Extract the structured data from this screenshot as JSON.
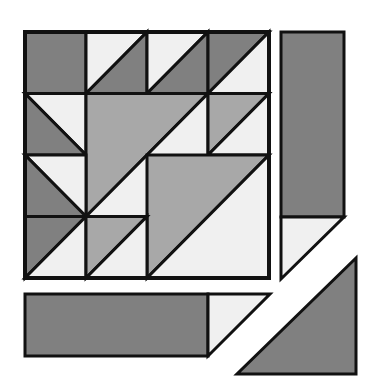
{
  "diagram": {
    "kind": "quilt-block-cutting-layout",
    "canvas": {
      "width": 368,
      "height": 383,
      "background": "#ffffff"
    },
    "palette": {
      "dark": "#808080",
      "medium": "#a8a8a8",
      "light": "#f0f0f0",
      "outline": "#111111",
      "background": "#ffffff"
    },
    "stroke_width": 3,
    "main_block": {
      "label": "Main pieced block",
      "x": 25,
      "y": 32,
      "width": 244,
      "height": 246,
      "grid_rows": 4,
      "grid_cols": 4,
      "cell_width": 61,
      "cell_height": 61.5,
      "units": [
        {
          "name": "r1c1-solid-dark",
          "row": 1,
          "col": 1,
          "type": "solid",
          "fill": "dark"
        },
        {
          "name": "r1c2-hst-light-dark",
          "row": 1,
          "col": 2,
          "type": "hst",
          "orientation": "tl-br",
          "fill_upper": "light",
          "fill_lower": "dark"
        },
        {
          "name": "r1c3-hst-light-dark",
          "row": 1,
          "col": 3,
          "type": "hst",
          "orientation": "tl-br",
          "fill_upper": "light",
          "fill_lower": "dark"
        },
        {
          "name": "r1c4-hst-dark-light",
          "row": 1,
          "col": 4,
          "type": "hst",
          "orientation": "tl-br",
          "fill_upper": "dark",
          "fill_lower": "light"
        },
        {
          "name": "r2c1-hst-dark-light",
          "row": 2,
          "col": 1,
          "type": "hst",
          "orientation": "tl-br",
          "fill_upper": "light",
          "fill_lower": "dark"
        },
        {
          "name": "r2c4-hst-medium-light",
          "row": 2,
          "col": 4,
          "type": "hst",
          "orientation": "tl-br",
          "fill_upper": "medium",
          "fill_lower": "light"
        },
        {
          "name": "r3c1-hst-light-dark",
          "row": 3,
          "col": 1,
          "type": "hst",
          "orientation": "tl-br",
          "fill_upper": "light",
          "fill_lower": "dark"
        },
        {
          "name": "r4c1-hst-dark-light",
          "row": 4,
          "col": 1,
          "type": "hst",
          "orientation": "tl-br",
          "fill_upper": "dark",
          "fill_lower": "light"
        },
        {
          "name": "r4c2-hst-medium-light",
          "row": 4,
          "col": 2,
          "type": "hst",
          "orientation": "tl-br",
          "fill_upper": "medium",
          "fill_lower": "light"
        },
        {
          "name": "center-upper-big-triangle",
          "type": "big-triangle",
          "span": "rows 2-3, cols 2-3",
          "fill": "medium",
          "note": "right angle top-left, hypotenuse runs to bottom-right"
        },
        {
          "name": "center-upper-light-triangle",
          "type": "big-triangle",
          "span": "rows 2-3, cols 2-3",
          "fill": "light",
          "note": "complementary half below hypotenuse"
        },
        {
          "name": "center-lower-big-triangle",
          "type": "big-triangle",
          "span": "rows 3-4, cols 3-4",
          "fill": "medium",
          "note": "right angle top-left"
        },
        {
          "name": "center-lower-light-triangle",
          "type": "big-triangle",
          "span": "rows 3-4, cols 3-4",
          "fill": "light"
        },
        {
          "name": "r2c3-light-filler",
          "row": 2,
          "col": 3,
          "type": "solid",
          "fill": "light"
        }
      ]
    },
    "side_piece": {
      "label": "Right side strip",
      "x": 281,
      "y": 32,
      "rect": {
        "x": 281,
        "y": 32,
        "width": 63,
        "height": 185,
        "fill": "dark"
      },
      "triangle": {
        "fill": "light",
        "note": "below strip, right angle at top-left"
      }
    },
    "bottom_piece": {
      "label": "Bottom strip",
      "rect": {
        "x": 25,
        "y": 294,
        "width": 183,
        "height": 62,
        "fill": "dark"
      },
      "triangle": {
        "fill": "light",
        "note": "to the right of the dark rectangle, right angle top-left"
      }
    },
    "corner_piece": {
      "label": "Bottom right corner triangle",
      "fill": "dark",
      "note": "right angle at bottom-right corner"
    }
  }
}
